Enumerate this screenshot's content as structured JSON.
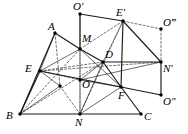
{
  "figure": {
    "background_color": "#ffffff",
    "stroke_color": "#1a1a1a",
    "label_color": "#000000",
    "width": 188,
    "height": 134,
    "points": [
      {
        "id": "Oprime",
        "label": "O′",
        "x": 80,
        "y": 14,
        "lx": 73,
        "ly": 1,
        "dot": true
      },
      {
        "id": "Eprime",
        "label": "E′",
        "x": 123,
        "y": 21,
        "lx": 116,
        "ly": 7,
        "dot": true
      },
      {
        "id": "Otriple",
        "label": "O‴",
        "x": 161,
        "y": 29,
        "lx": 163,
        "ly": 17,
        "dot": true
      },
      {
        "id": "A",
        "label": "A",
        "x": 55,
        "y": 33,
        "lx": 48,
        "ly": 21,
        "dot": true
      },
      {
        "id": "M",
        "label": "M",
        "x": 80,
        "y": 49,
        "lx": 82,
        "ly": 33,
        "dot": true
      },
      {
        "id": "D",
        "label": "D",
        "x": 103,
        "y": 62,
        "lx": 105,
        "ly": 49,
        "dot": true
      },
      {
        "id": "Nprime",
        "label": "N′",
        "x": 161,
        "y": 62,
        "lx": 163,
        "ly": 63,
        "dot": true
      },
      {
        "id": "E",
        "label": "E",
        "x": 40,
        "y": 71,
        "lx": 25,
        "ly": 63,
        "dot": true
      },
      {
        "id": "O",
        "label": "O",
        "x": 80,
        "y": 80,
        "lx": 82,
        "ly": 79,
        "dot": true
      },
      {
        "id": "P",
        "label": "",
        "x": 60,
        "y": 86,
        "lx": 0,
        "ly": 0,
        "dot": true
      },
      {
        "id": "F",
        "label": "F",
        "x": 121,
        "y": 87,
        "lx": 118,
        "ly": 90,
        "dot": true
      },
      {
        "id": "Odouble",
        "label": "O″",
        "x": 161,
        "y": 95,
        "lx": 163,
        "ly": 96,
        "dot": true
      },
      {
        "id": "B",
        "label": "B",
        "x": 20,
        "y": 114,
        "lx": 6,
        "ly": 110,
        "dot": true
      },
      {
        "id": "N",
        "label": "N",
        "x": 80,
        "y": 114,
        "lx": 75,
        "ly": 117,
        "dot": true
      },
      {
        "id": "C",
        "label": "C",
        "x": 141,
        "y": 114,
        "lx": 144,
        "ly": 111,
        "dot": true
      }
    ],
    "segments_solid": [
      {
        "from": "B",
        "to": "A",
        "name": "segment-BA"
      },
      {
        "from": "A",
        "to": "M",
        "name": "segment-AM"
      },
      {
        "from": "M",
        "to": "D",
        "name": "segment-MD"
      },
      {
        "from": "D",
        "to": "F",
        "name": "segment-DF"
      },
      {
        "from": "F",
        "to": "C",
        "name": "segment-FC"
      },
      {
        "from": "B",
        "to": "C",
        "name": "segment-BC"
      },
      {
        "from": "B",
        "to": "E",
        "name": "segment-BE"
      },
      {
        "from": "Oprime",
        "to": "M",
        "name": "segment-Oprime-M"
      },
      {
        "from": "Oprime",
        "to": "Eprime",
        "name": "segment-Oprime-Eprime"
      },
      {
        "from": "Eprime",
        "to": "Nprime",
        "name": "segment-Eprime-Nprime"
      },
      {
        "from": "D",
        "to": "Nprime",
        "name": "segment-D-Nprime"
      },
      {
        "from": "Nprime",
        "to": "Odouble",
        "name": "segment-Nprime-Odouble"
      },
      {
        "from": "F",
        "to": "Odouble",
        "name": "segment-F-Odouble"
      },
      {
        "from": "E",
        "to": "F",
        "name": "segment-EF"
      },
      {
        "from": "Eprime",
        "to": "F",
        "name": "segment-Eprime-F"
      }
    ],
    "segments_dashed": [
      {
        "from": "Oprime",
        "to": "O",
        "name": "dashed-Oprime-O"
      },
      {
        "from": "O",
        "to": "N",
        "name": "dashed-O-N"
      },
      {
        "from": "Otriple",
        "to": "Nprime",
        "name": "dashed-Otriple-Nprime"
      },
      {
        "from": "Eprime",
        "to": "Otriple",
        "name": "dashed-Eprime-Otriple"
      },
      {
        "from": "Eprime",
        "to": "M",
        "name": "dashed-Eprime-M"
      },
      {
        "from": "Eprime",
        "to": "D",
        "name": "dashed-Eprime-D"
      },
      {
        "from": "E",
        "to": "O",
        "name": "dashed-E-O"
      },
      {
        "from": "E",
        "to": "D",
        "name": "dashed-E-D"
      },
      {
        "from": "E",
        "to": "Nprime",
        "name": "dashed-E-Nprime"
      },
      {
        "from": "B",
        "to": "D",
        "name": "dashed-B-D"
      },
      {
        "from": "B",
        "to": "M",
        "name": "dashed-B-M"
      },
      {
        "from": "N",
        "to": "Eprime",
        "name": "dashed-N-Eprime"
      },
      {
        "from": "A",
        "to": "P",
        "name": "dashed-A-P"
      },
      {
        "from": "P",
        "to": "N",
        "name": "dashed-P-N"
      },
      {
        "from": "M",
        "to": "N",
        "name": "dashed-M-N"
      }
    ],
    "segments_thin": [
      {
        "from": "E",
        "to": "M",
        "name": "thin-E-M"
      },
      {
        "from": "O",
        "to": "D",
        "name": "thin-O-D"
      },
      {
        "from": "O",
        "to": "F",
        "name": "thin-O-F"
      },
      {
        "from": "N",
        "to": "F",
        "name": "thin-N-F"
      },
      {
        "from": "N",
        "to": "D",
        "name": "thin-N-D"
      },
      {
        "from": "E",
        "to": "P",
        "name": "thin-E-P"
      },
      {
        "from": "B",
        "to": "P",
        "name": "thin-B-P"
      },
      {
        "from": "A",
        "to": "E",
        "name": "thin-A-E"
      },
      {
        "from": "O",
        "to": "Nprime",
        "name": "thin-O-Nprime"
      },
      {
        "from": "M",
        "to": "F",
        "name": "thin-M-F"
      }
    ]
  }
}
